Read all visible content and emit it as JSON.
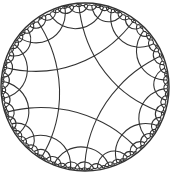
{
  "diagram": {
    "type": "hyperbolic-tiling",
    "model": "poincare-disk",
    "schlafli": {
      "p": 5,
      "q": 4
    },
    "disk": {
      "cx": 85,
      "cy": 87,
      "r": 84
    },
    "rotation_deg": -74,
    "center_offset": {
      "x": 0,
      "y": 2
    },
    "max_depth": 7,
    "colors": {
      "line": "#333333",
      "background": "#ffffff"
    },
    "stroke_width": 1.1
  }
}
